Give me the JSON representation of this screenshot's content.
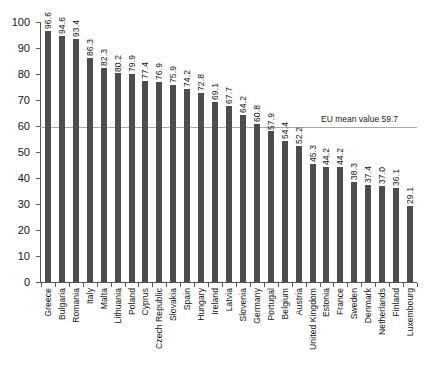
{
  "chart_data": {
    "type": "bar",
    "title": "",
    "subtitle": "",
    "xlabel": "",
    "ylabel": "",
    "ylim": [
      0,
      100
    ],
    "yticks": [
      0,
      10,
      20,
      30,
      40,
      50,
      60,
      70,
      80,
      90,
      100
    ],
    "grid": false,
    "legend": false,
    "bar_color": "#4d4d4d",
    "axis_color": "#555555",
    "reference_line": {
      "label": "EU mean value 59.7",
      "value": 59.7,
      "color": "#a8a8a8"
    },
    "categories": [
      "Greece",
      "Bulgaria",
      "Romania",
      "Italy",
      "Malta",
      "Lithuania",
      "Poland",
      "Cyprus",
      "Czech Republic",
      "Slovakia",
      "Spain",
      "Hungary",
      "Ireland",
      "Latvia",
      "Slovenia",
      "Germany",
      "Portugal",
      "Belgium",
      "Austria",
      "United Kingdom",
      "Estonia",
      "France",
      "Sweden",
      "Denmark",
      "Netherlands",
      "Finland",
      "Luxembourg"
    ],
    "values": [
      96.6,
      94.6,
      93.4,
      86.3,
      82.3,
      80.2,
      79.9,
      77.4,
      76.9,
      75.9,
      74.2,
      72.8,
      69.1,
      67.7,
      64.2,
      60.8,
      57.9,
      54.4,
      52.2,
      45.3,
      44.2,
      44.2,
      38.3,
      37.4,
      37.0,
      36.1,
      29.1
    ],
    "value_labels": [
      "96.6",
      "94.6",
      "93.4",
      "86.3",
      "82.3",
      "80.2",
      "79.9",
      "77.4",
      "76.9",
      "75.9",
      "74.2",
      "72.8",
      "69.1",
      "67.7",
      "64.2",
      "60.8",
      "57.9",
      "54.4",
      "52.2",
      "45.3",
      "44.2",
      "44.2",
      "38.3",
      "37.4",
      "37.0",
      "36.1",
      "29.1"
    ],
    "ytick_labels": [
      "0",
      "10",
      "20",
      "30",
      "40",
      "50",
      "60",
      "70",
      "80",
      "90",
      "100"
    ]
  }
}
